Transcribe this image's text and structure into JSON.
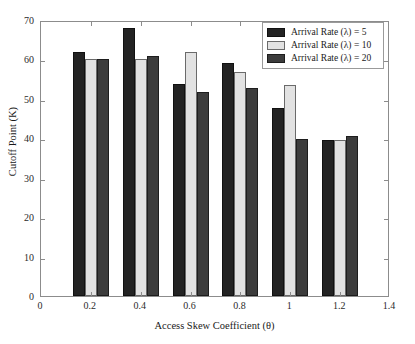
{
  "chart_data": {
    "type": "bar",
    "title": "",
    "xlabel": "Access Skew Coefficient (θ)",
    "ylabel": "Cutoff Point (K)",
    "categories": [
      "0.2",
      "0.4",
      "0.6",
      "0.8",
      "1",
      "1.2"
    ],
    "x": [
      0.2,
      0.4,
      0.6,
      0.8,
      1.0,
      1.2
    ],
    "xlim": [
      0,
      1.4
    ],
    "ylim": [
      0,
      70
    ],
    "xticks": [
      "0",
      "0.2",
      "0.4",
      "0.6",
      "0.8",
      "1",
      "1.2",
      "1.4"
    ],
    "xtick_values": [
      0,
      0.2,
      0.4,
      0.6,
      0.8,
      1.0,
      1.2,
      1.4
    ],
    "yticks": [
      "0",
      "10",
      "20",
      "30",
      "40",
      "50",
      "60",
      "70"
    ],
    "ytick_values": [
      0,
      10,
      20,
      30,
      40,
      50,
      60,
      70
    ],
    "grid": false,
    "legend_position": "upper right",
    "series": [
      {
        "name": "Arrival Rate (λ) = 5",
        "color": "#232323",
        "values": [
          62.0,
          68.0,
          53.8,
          59.0,
          47.7,
          39.5
        ]
      },
      {
        "name": "Arrival Rate (λ) = 10",
        "color": "#e2e2e2",
        "values": [
          60.0,
          60.0,
          61.8,
          56.8,
          53.5,
          39.5
        ]
      },
      {
        "name": "Arrival Rate (λ) = 20",
        "color": "#3c3c3c",
        "values": [
          60.0,
          61.0,
          51.8,
          52.7,
          39.7,
          40.5
        ]
      }
    ]
  },
  "legend": {
    "entries": [
      "Arrival Rate (λ) = 5",
      "Arrival Rate (λ) = 10",
      "Arrival Rate (λ) = 20"
    ]
  },
  "axes": {
    "x_title": "Access Skew Coefficient (θ)",
    "y_title": "Cutoff Point (K)"
  }
}
